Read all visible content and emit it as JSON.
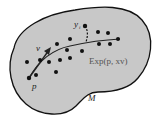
{
  "diagram": {
    "manifold_label": "M",
    "base_point_label": "p",
    "vector_label": "v",
    "observation_label": "y",
    "observation_subscript": "i",
    "curve_label": "Exp(p, xv)",
    "colors": {
      "manifold_fill": "#c8c8c8",
      "outline": "#111111",
      "points": "#111111",
      "curve_label": "#555555"
    }
  }
}
